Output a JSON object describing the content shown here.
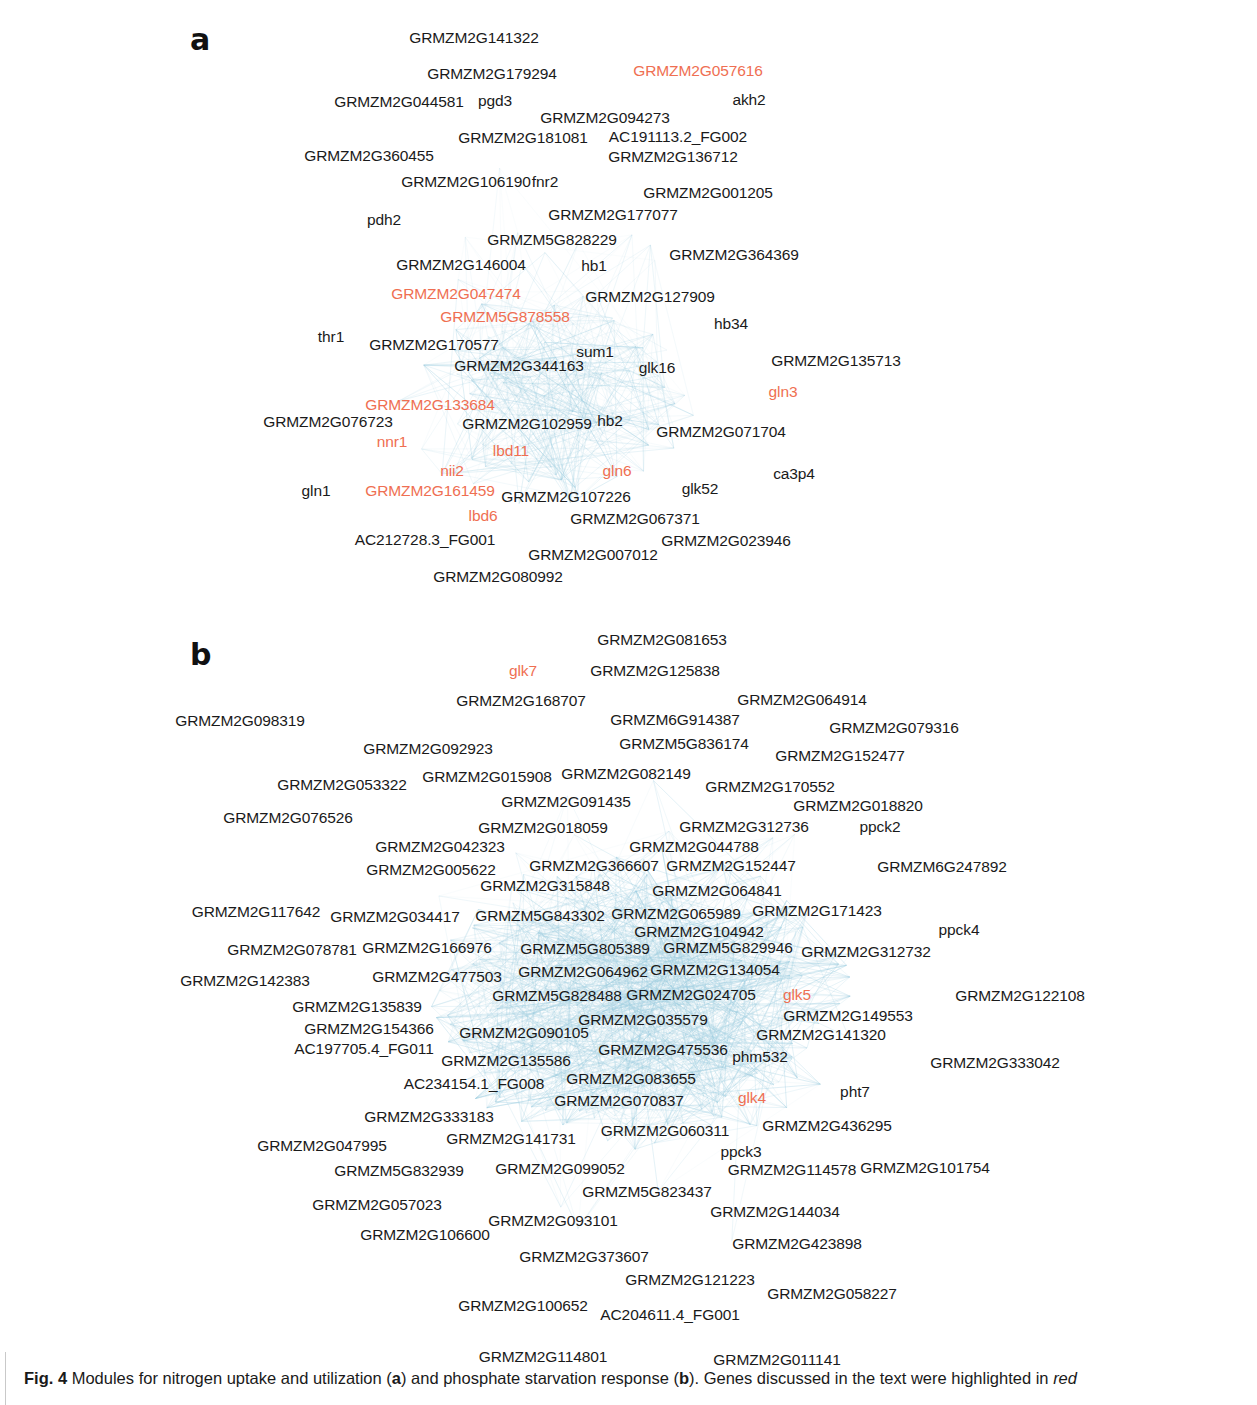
{
  "figure": {
    "caption_prefix": "Fig. 4",
    "caption_part1": " Modules for nitrogen uptake and utilization (",
    "caption_a": "a",
    "caption_part2": ") and phosphate starvation response (",
    "caption_b": "b",
    "caption_part3": "). Genes discussed in the text were highlighted in ",
    "caption_red_word": "red"
  },
  "colors": {
    "highlight_red": "#ef6f52",
    "node_text": "#1a1a1a",
    "edge": "#9fd0e3",
    "background": "#ffffff"
  },
  "panels": [
    {
      "letter": "a",
      "title": "nitrogen uptake and utilization",
      "nodes": [
        {
          "label": "GRMZM2G141322",
          "x": 474,
          "y": 38,
          "red": false
        },
        {
          "label": "GRMZM2G179294",
          "x": 492,
          "y": 74,
          "red": false
        },
        {
          "label": "GRMZM2G057616",
          "x": 698,
          "y": 71,
          "red": true
        },
        {
          "label": "GRMZM2G044581",
          "x": 399,
          "y": 102,
          "red": false
        },
        {
          "label": "pgd3",
          "x": 495,
          "y": 101,
          "red": false
        },
        {
          "label": "akh2",
          "x": 749,
          "y": 100,
          "red": false
        },
        {
          "label": "GRMZM2G094273",
          "x": 605,
          "y": 118,
          "red": false
        },
        {
          "label": "GRMZM2G181081",
          "x": 523,
          "y": 138,
          "red": false
        },
        {
          "label": "AC191113.2_FG002",
          "x": 678,
          "y": 137,
          "red": false
        },
        {
          "label": "GRMZM2G360455",
          "x": 369,
          "y": 156,
          "red": false
        },
        {
          "label": "GRMZM2G136712",
          "x": 673,
          "y": 157,
          "red": false
        },
        {
          "label": "GRMZM2G106190",
          "x": 466,
          "y": 182,
          "red": false
        },
        {
          "label": "fnr2",
          "x": 545,
          "y": 182,
          "red": false
        },
        {
          "label": "GRMZM2G001205",
          "x": 708,
          "y": 193,
          "red": false
        },
        {
          "label": "pdh2",
          "x": 384,
          "y": 220,
          "red": false
        },
        {
          "label": "GRMZM2G177077",
          "x": 613,
          "y": 215,
          "red": false
        },
        {
          "label": "GRMZM5G828229",
          "x": 552,
          "y": 240,
          "red": false
        },
        {
          "label": "GRMZM2G364369",
          "x": 734,
          "y": 255,
          "red": false
        },
        {
          "label": "GRMZM2G146004",
          "x": 461,
          "y": 265,
          "red": false
        },
        {
          "label": "hb1",
          "x": 594,
          "y": 266,
          "red": false
        },
        {
          "label": "GRMZM2G047474",
          "x": 456,
          "y": 294,
          "red": true
        },
        {
          "label": "GRMZM2G127909",
          "x": 650,
          "y": 297,
          "red": false
        },
        {
          "label": "GRMZM5G878558",
          "x": 505,
          "y": 317,
          "red": true
        },
        {
          "label": "thr1",
          "x": 331,
          "y": 337,
          "red": false
        },
        {
          "label": "hb34",
          "x": 731,
          "y": 324,
          "red": false
        },
        {
          "label": "GRMZM2G170577",
          "x": 434,
          "y": 345,
          "red": false
        },
        {
          "label": "sum1",
          "x": 595,
          "y": 352,
          "red": false
        },
        {
          "label": "GRMZM2G135713",
          "x": 836,
          "y": 361,
          "red": false
        },
        {
          "label": "GRMZM2G344163",
          "x": 519,
          "y": 366,
          "red": false
        },
        {
          "label": "glk16",
          "x": 657,
          "y": 368,
          "red": false
        },
        {
          "label": "gln3",
          "x": 783,
          "y": 392,
          "red": true
        },
        {
          "label": "GRMZM2G133684",
          "x": 430,
          "y": 405,
          "red": true
        },
        {
          "label": "GRMZM2G076723",
          "x": 328,
          "y": 422,
          "red": false
        },
        {
          "label": "GRMZM2G102959",
          "x": 527,
          "y": 424,
          "red": false
        },
        {
          "label": "hb2",
          "x": 610,
          "y": 421,
          "red": false
        },
        {
          "label": "GRMZM2G071704",
          "x": 721,
          "y": 432,
          "red": false
        },
        {
          "label": "nnr1",
          "x": 392,
          "y": 442,
          "red": true
        },
        {
          "label": "lbd11",
          "x": 511,
          "y": 451,
          "red": true
        },
        {
          "label": "nii2",
          "x": 452,
          "y": 471,
          "red": true
        },
        {
          "label": "gln6",
          "x": 617,
          "y": 471,
          "red": true
        },
        {
          "label": "ca3p4",
          "x": 794,
          "y": 474,
          "red": false
        },
        {
          "label": "gln1",
          "x": 316,
          "y": 491,
          "red": false
        },
        {
          "label": "GRMZM2G161459",
          "x": 430,
          "y": 491,
          "red": true
        },
        {
          "label": "GRMZM2G107226",
          "x": 566,
          "y": 497,
          "red": false
        },
        {
          "label": "glk52",
          "x": 700,
          "y": 489,
          "red": false
        },
        {
          "label": "lbd6",
          "x": 483,
          "y": 516,
          "red": true
        },
        {
          "label": "GRMZM2G067371",
          "x": 635,
          "y": 519,
          "red": false
        },
        {
          "label": "AC212728.3_FG001",
          "x": 425,
          "y": 540,
          "red": false
        },
        {
          "label": "GRMZM2G023946",
          "x": 726,
          "y": 541,
          "red": false
        },
        {
          "label": "GRMZM2G007012",
          "x": 593,
          "y": 555,
          "red": false
        },
        {
          "label": "GRMZM2G080992",
          "x": 498,
          "y": 577,
          "red": false
        }
      ]
    },
    {
      "letter": "b",
      "title": "phosphate starvation response",
      "nodes": [
        {
          "label": "GRMZM2G081653",
          "x": 662,
          "y": 640,
          "red": false
        },
        {
          "label": "glk7",
          "x": 523,
          "y": 671,
          "red": true
        },
        {
          "label": "GRMZM2G125838",
          "x": 655,
          "y": 671,
          "red": false
        },
        {
          "label": "GRMZM2G168707",
          "x": 521,
          "y": 701,
          "red": false
        },
        {
          "label": "GRMZM2G064914",
          "x": 802,
          "y": 700,
          "red": false
        },
        {
          "label": "GRMZM2G098319",
          "x": 240,
          "y": 721,
          "red": false
        },
        {
          "label": "GRMZM6G914387",
          "x": 675,
          "y": 720,
          "red": false
        },
        {
          "label": "GRMZM2G079316",
          "x": 894,
          "y": 728,
          "red": false
        },
        {
          "label": "GRMZM2G092923",
          "x": 428,
          "y": 749,
          "red": false
        },
        {
          "label": "GRMZM5G836174",
          "x": 684,
          "y": 744,
          "red": false
        },
        {
          "label": "GRMZM2G152477",
          "x": 840,
          "y": 756,
          "red": false
        },
        {
          "label": "GRMZM2G053322",
          "x": 342,
          "y": 785,
          "red": false
        },
        {
          "label": "GRMZM2G015908",
          "x": 487,
          "y": 777,
          "red": false
        },
        {
          "label": "GRMZM2G082149",
          "x": 626,
          "y": 774,
          "red": false
        },
        {
          "label": "GRMZM2G170552",
          "x": 770,
          "y": 787,
          "red": false
        },
        {
          "label": "GRMZM2G091435",
          "x": 566,
          "y": 802,
          "red": false
        },
        {
          "label": "GRMZM2G018820",
          "x": 858,
          "y": 806,
          "red": false
        },
        {
          "label": "GRMZM2G076526",
          "x": 288,
          "y": 818,
          "red": false
        },
        {
          "label": "GRMZM2G018059",
          "x": 543,
          "y": 828,
          "red": false
        },
        {
          "label": "GRMZM2G312736",
          "x": 744,
          "y": 827,
          "red": false
        },
        {
          "label": "ppck2",
          "x": 880,
          "y": 827,
          "red": false
        },
        {
          "label": "GRMZM2G042323",
          "x": 440,
          "y": 847,
          "red": false
        },
        {
          "label": "GRMZM2G044788",
          "x": 694,
          "y": 847,
          "red": false
        },
        {
          "label": "GRMZM2G005622",
          "x": 431,
          "y": 870,
          "red": false
        },
        {
          "label": "GRMZM2G366607",
          "x": 594,
          "y": 866,
          "red": false
        },
        {
          "label": "GRMZM2G152447",
          "x": 731,
          "y": 866,
          "red": false
        },
        {
          "label": "GRMZM6G247892",
          "x": 942,
          "y": 867,
          "red": false
        },
        {
          "label": "GRMZM2G315848",
          "x": 545,
          "y": 886,
          "red": false
        },
        {
          "label": "GRMZM2G064841",
          "x": 717,
          "y": 891,
          "red": false
        },
        {
          "label": "GRMZM2G117642",
          "x": 256,
          "y": 912,
          "red": false
        },
        {
          "label": "GRMZM2G034417",
          "x": 395,
          "y": 917,
          "red": false
        },
        {
          "label": "GRMZM5G843302",
          "x": 540,
          "y": 916,
          "red": false
        },
        {
          "label": "GRMZM2G065989",
          "x": 676,
          "y": 914,
          "red": false
        },
        {
          "label": "GRMZM2G171423",
          "x": 817,
          "y": 911,
          "red": false
        },
        {
          "label": "GRMZM2G104942",
          "x": 699,
          "y": 932,
          "red": false
        },
        {
          "label": "ppck4",
          "x": 959,
          "y": 930,
          "red": false
        },
        {
          "label": "GRMZM2G078781",
          "x": 292,
          "y": 950,
          "red": false
        },
        {
          "label": "GRMZM2G166976",
          "x": 427,
          "y": 948,
          "red": false
        },
        {
          "label": "GRMZM5G805389",
          "x": 585,
          "y": 949,
          "red": false
        },
        {
          "label": "GRMZM5G829946",
          "x": 728,
          "y": 948,
          "red": false
        },
        {
          "label": "GRMZM2G312732",
          "x": 866,
          "y": 952,
          "red": false
        },
        {
          "label": "GRMZM2G142383",
          "x": 245,
          "y": 981,
          "red": false
        },
        {
          "label": "GRMZM2G477503",
          "x": 437,
          "y": 977,
          "red": false
        },
        {
          "label": "GRMZM2G064962",
          "x": 583,
          "y": 972,
          "red": false
        },
        {
          "label": "GRMZM2G134054",
          "x": 715,
          "y": 970,
          "red": false
        },
        {
          "label": "GRMZM2G135839",
          "x": 357,
          "y": 1007,
          "red": false
        },
        {
          "label": "GRMZM5G828488",
          "x": 557,
          "y": 996,
          "red": false
        },
        {
          "label": "GRMZM2G024705",
          "x": 691,
          "y": 995,
          "red": false
        },
        {
          "label": "glk5",
          "x": 797,
          "y": 995,
          "red": true
        },
        {
          "label": "GRMZM2G122108",
          "x": 1020,
          "y": 996,
          "red": false
        },
        {
          "label": "GRMZM2G149553",
          "x": 848,
          "y": 1016,
          "red": false
        },
        {
          "label": "GRMZM2G154366",
          "x": 369,
          "y": 1029,
          "red": false
        },
        {
          "label": "GRMZM2G090105",
          "x": 524,
          "y": 1033,
          "red": false
        },
        {
          "label": "GRMZM2G035579",
          "x": 643,
          "y": 1020,
          "red": false
        },
        {
          "label": "GRMZM2G141320",
          "x": 821,
          "y": 1035,
          "red": false
        },
        {
          "label": "AC197705.4_FG011",
          "x": 364,
          "y": 1049,
          "red": false
        },
        {
          "label": "GRMZM2G475536",
          "x": 663,
          "y": 1050,
          "red": false
        },
        {
          "label": "GRMZM2G135586",
          "x": 506,
          "y": 1061,
          "red": false
        },
        {
          "label": "phm532",
          "x": 760,
          "y": 1057,
          "red": false
        },
        {
          "label": "GRMZM2G333042",
          "x": 995,
          "y": 1063,
          "red": false
        },
        {
          "label": "AC234154.1_FG008",
          "x": 474,
          "y": 1084,
          "red": false
        },
        {
          "label": "GRMZM2G083655",
          "x": 631,
          "y": 1079,
          "red": false
        },
        {
          "label": "GRMZM2G070837",
          "x": 619,
          "y": 1101,
          "red": false
        },
        {
          "label": "glk4",
          "x": 752,
          "y": 1098,
          "red": true
        },
        {
          "label": "pht7",
          "x": 855,
          "y": 1092,
          "red": false
        },
        {
          "label": "GRMZM2G333183",
          "x": 429,
          "y": 1117,
          "red": false
        },
        {
          "label": "GRMZM2G060311",
          "x": 665,
          "y": 1131,
          "red": false
        },
        {
          "label": "GRMZM2G436295",
          "x": 827,
          "y": 1126,
          "red": false
        },
        {
          "label": "GRMZM2G141731",
          "x": 511,
          "y": 1139,
          "red": false
        },
        {
          "label": "GRMZM2G047995",
          "x": 322,
          "y": 1146,
          "red": false
        },
        {
          "label": "ppck3",
          "x": 741,
          "y": 1152,
          "red": false
        },
        {
          "label": "GRMZM5G832939",
          "x": 399,
          "y": 1171,
          "red": false
        },
        {
          "label": "GRMZM2G099052",
          "x": 560,
          "y": 1169,
          "red": false
        },
        {
          "label": "GRMZM2G114578",
          "x": 792,
          "y": 1170,
          "red": false
        },
        {
          "label": "GRMZM2G101754",
          "x": 925,
          "y": 1168,
          "red": false
        },
        {
          "label": "GRMZM5G823437",
          "x": 647,
          "y": 1192,
          "red": false
        },
        {
          "label": "GRMZM2G057023",
          "x": 377,
          "y": 1205,
          "red": false
        },
        {
          "label": "GRMZM2G144034",
          "x": 775,
          "y": 1212,
          "red": false
        },
        {
          "label": "GRMZM2G093101",
          "x": 553,
          "y": 1221,
          "red": false
        },
        {
          "label": "GRMZM2G106600",
          "x": 425,
          "y": 1235,
          "red": false
        },
        {
          "label": "GRMZM2G423898",
          "x": 797,
          "y": 1244,
          "red": false
        },
        {
          "label": "GRMZM2G373607",
          "x": 584,
          "y": 1257,
          "red": false
        },
        {
          "label": "GRMZM2G121223",
          "x": 690,
          "y": 1280,
          "red": false
        },
        {
          "label": "GRMZM2G058227",
          "x": 832,
          "y": 1294,
          "red": false
        },
        {
          "label": "GRMZM2G100652",
          "x": 523,
          "y": 1306,
          "red": false
        },
        {
          "label": "AC204611.4_FG001",
          "x": 670,
          "y": 1315,
          "red": false
        },
        {
          "label": "GRMZM2G114801",
          "x": 543,
          "y": 1357,
          "red": false
        },
        {
          "label": "GRMZM2G011141",
          "x": 777,
          "y": 1360,
          "red": false
        }
      ]
    }
  ]
}
